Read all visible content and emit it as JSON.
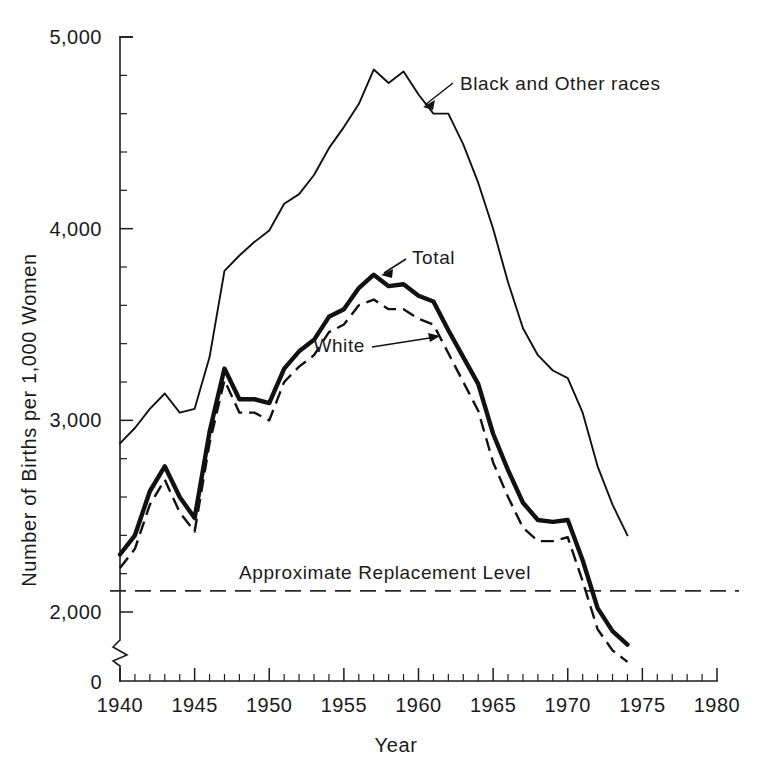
{
  "chart_data": {
    "type": "line",
    "title": "",
    "xlabel": "Year",
    "ylabel": "Number of Births per 1,000 Women",
    "xlim": [
      1940,
      1980
    ],
    "ylim": [
      1500,
      5000
    ],
    "grid": false,
    "legend_position": "inline-annotations",
    "x_major_ticks": [
      1940,
      1945,
      1950,
      1955,
      1960,
      1965,
      1970,
      1975,
      1980
    ],
    "x_tick_labels": [
      "1940",
      "1945",
      "1950",
      "1955",
      "1960",
      "1965",
      "1970",
      "1975",
      "1980"
    ],
    "x_minor_tick_step": 1,
    "y_major_ticks": [
      2000,
      3000,
      4000,
      5000
    ],
    "y_tick_labels": [
      "2,000",
      "3,000",
      "4,000",
      "5,000"
    ],
    "y_origin_label": "0",
    "y_axis_break": true,
    "y_minor_tick_step": 200,
    "x": [
      1940,
      1941,
      1942,
      1943,
      1944,
      1945,
      1946,
      1947,
      1948,
      1949,
      1950,
      1951,
      1952,
      1953,
      1954,
      1955,
      1956,
      1957,
      1958,
      1959,
      1960,
      1961,
      1962,
      1963,
      1964,
      1965,
      1966,
      1967,
      1968,
      1969,
      1970,
      1971,
      1972,
      1973,
      1974
    ],
    "series": [
      {
        "name": "Black and Other races",
        "style": "thin-solid",
        "values": [
          2880,
          2960,
          3060,
          3140,
          3040,
          3060,
          3330,
          3780,
          3860,
          3930,
          3990,
          4130,
          4180,
          4280,
          4420,
          4530,
          4650,
          4830,
          4760,
          4820,
          4700,
          4600,
          4600,
          4440,
          4240,
          4000,
          3720,
          3480,
          3340,
          3260,
          3220,
          3040,
          2760,
          2560,
          2400
        ]
      },
      {
        "name": "Total",
        "style": "thick-solid",
        "values": [
          2300,
          2400,
          2630,
          2760,
          2600,
          2490,
          2940,
          3270,
          3110,
          3110,
          3090,
          3270,
          3360,
          3420,
          3540,
          3580,
          3690,
          3760,
          3700,
          3710,
          3650,
          3620,
          3470,
          3330,
          3190,
          2930,
          2740,
          2570,
          2480,
          2470,
          2480,
          2270,
          2020,
          1900,
          1830
        ]
      },
      {
        "name": "White",
        "style": "dashed",
        "values": [
          2230,
          2330,
          2560,
          2690,
          2520,
          2420,
          2880,
          3210,
          3040,
          3040,
          3000,
          3200,
          3280,
          3340,
          3460,
          3500,
          3600,
          3630,
          3580,
          3580,
          3530,
          3500,
          3350,
          3200,
          3050,
          2780,
          2600,
          2440,
          2370,
          2370,
          2390,
          2160,
          1910,
          1800,
          1740
        ]
      }
    ],
    "reference_line": {
      "label": "Approximate Replacement Level",
      "value": 2110,
      "style": "dashed"
    },
    "annotations": [
      {
        "text": "Black and Other races",
        "target_year": 1961,
        "target_value": 4600
      },
      {
        "text": "Total",
        "target_year": 1957,
        "target_value": 3760
      },
      {
        "text": "White",
        "target_year": 1962,
        "target_value": 3350
      }
    ],
    "colors": {
      "ink": "#111111",
      "background": "#ffffff",
      "axis": "#1d1d1d"
    }
  }
}
